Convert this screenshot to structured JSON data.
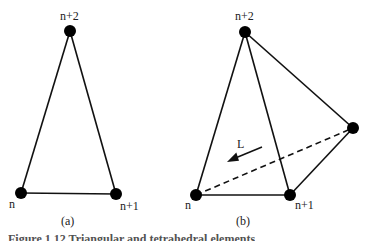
{
  "diagram": {
    "a": {
      "sublabel": "(a)",
      "nodes": [
        {
          "id": "n",
          "label": "n"
        },
        {
          "id": "n1",
          "label": "n+1"
        },
        {
          "id": "n2",
          "label": "n+2"
        }
      ],
      "edges": [
        [
          "n",
          "n1"
        ],
        [
          "n1",
          "n2"
        ],
        [
          "n2",
          "n"
        ]
      ]
    },
    "b": {
      "sublabel": "(b)",
      "nodes": [
        {
          "id": "n",
          "label": "n"
        },
        {
          "id": "n1",
          "label": "n+1"
        },
        {
          "id": "n2",
          "label": "n+2"
        },
        {
          "id": "n3",
          "label": ""
        }
      ],
      "edges_solid": [
        [
          "n",
          "n1"
        ],
        [
          "n",
          "n2"
        ],
        [
          "n1",
          "n2"
        ],
        [
          "n2",
          "n3"
        ],
        [
          "n1",
          "n3"
        ]
      ],
      "edges_dashed": [
        [
          "n",
          "n3"
        ]
      ],
      "arrow_label": "L"
    },
    "caption": "Figure 1.12  Triangular and tetrahedral elements"
  }
}
